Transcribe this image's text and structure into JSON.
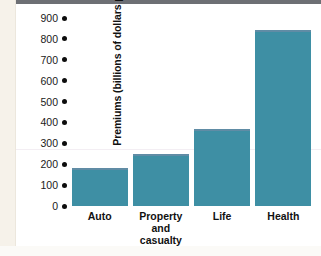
{
  "chart_data": {
    "type": "bar",
    "title": "",
    "xlabel": "",
    "ylabel": "Premiums (billions of dollars per year)",
    "categories": [
      "Auto",
      "Property and casualty",
      "Life",
      "Health"
    ],
    "category_lines": [
      [
        "Auto"
      ],
      [
        "Property",
        "and casualty"
      ],
      [
        "Life"
      ],
      [
        "Health"
      ]
    ],
    "values": [
      180,
      247,
      370,
      845
    ],
    "ylim": [
      0,
      900
    ],
    "yticks": [
      0,
      100,
      200,
      300,
      400,
      500,
      600,
      700,
      800,
      900
    ],
    "ytick_labels": [
      "0",
      "100",
      "200",
      "300",
      "400",
      "500",
      "600",
      "700",
      "800",
      "900"
    ],
    "grid": false,
    "legend": null,
    "bar_color": "#3e8fa4",
    "bar_cap_color": "#7b8ba6",
    "tick_marker": "filled-circle",
    "axis_text_color": "#111111",
    "background": "#ffffff"
  }
}
